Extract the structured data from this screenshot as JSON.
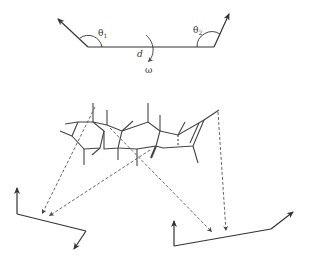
{
  "figure": {
    "labels": {
      "theta1": "θ",
      "theta1_sub": "1",
      "theta2": "θ",
      "theta2_sub": "2",
      "distance": "d",
      "dihedral": "ω"
    },
    "colors": {
      "line": "#333333",
      "dashed": "#555555",
      "background": "#ffffff"
    },
    "parts": [
      "top-schematic: two vectors joined by segment with angles θ1, θ2, distance d and dihedral ω",
      "middle: steroid-like fused-ring molecule",
      "bottom: two vector-pair schematics connected to molecule by dashed arrows"
    ]
  }
}
